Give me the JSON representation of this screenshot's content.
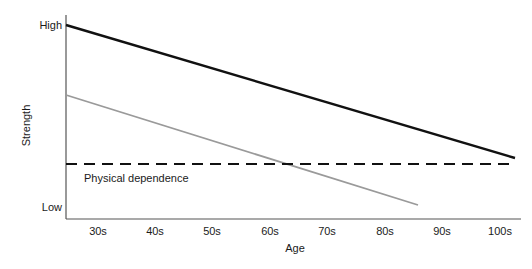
{
  "chart_data": {
    "type": "line",
    "title": "",
    "subtitle": "",
    "xlabel": "Age",
    "ylabel": "Strength",
    "grid": false,
    "legend_position": "none",
    "xlim": [
      25,
      105
    ],
    "ylim": [
      0,
      100
    ],
    "x_tick_labels": [
      "30s",
      "40s",
      "50s",
      "60s",
      "70s",
      "80s",
      "90s",
      "100s"
    ],
    "x_tick_values": [
      30,
      40,
      50,
      60,
      70,
      80,
      90,
      100
    ],
    "y_tick_labels": [
      "High",
      "Low"
    ],
    "y_tick_values": [
      100,
      5
    ],
    "series": [
      {
        "name": "upper-strength-curve",
        "color": "#111111",
        "style": "solid",
        "width": 2.4,
        "x": [
          26,
          105
        ],
        "values": [
          100,
          31.5
        ]
      },
      {
        "name": "lower-strength-curve",
        "color": "#9a9a9a",
        "style": "solid",
        "width": 1.8,
        "x": [
          26,
          88
        ],
        "values": [
          64,
          7.5
        ]
      }
    ],
    "annotations": [
      {
        "name": "physical-dependence-threshold",
        "label": "Physical dependence",
        "type": "hline",
        "value": 27,
        "style": "dashed",
        "color": "#111111",
        "x_start": 26,
        "x_end": 104.5
      }
    ],
    "axis_color": "#555555"
  },
  "axes": {
    "y_high_label": "High",
    "y_low_label": "Low",
    "y_title": "Strength",
    "x_title": "Age"
  },
  "ticks": {
    "x": [
      {
        "label": "30s",
        "px": 98
      },
      {
        "label": "40s",
        "px": 155
      },
      {
        "label": "50s",
        "px": 212
      },
      {
        "label": "60s",
        "px": 270
      },
      {
        "label": "70s",
        "px": 327
      },
      {
        "label": "80s",
        "px": 385
      },
      {
        "label": "90s",
        "px": 442
      },
      {
        "label": "100s",
        "px": 500
      }
    ]
  },
  "threshold": {
    "label": "Physical dependence"
  },
  "colors": {
    "line_primary": "#111111",
    "line_secondary": "#9a9a9a",
    "axis": "#555555",
    "text": "#1a1a1a",
    "background": "#ffffff"
  }
}
